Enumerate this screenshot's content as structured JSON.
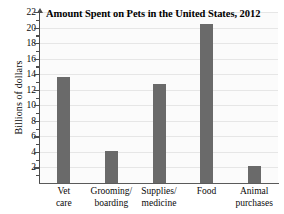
{
  "chart_data": {
    "type": "bar",
    "title": "Amount Spent on Pets in the United States, 2012",
    "xlabel": "",
    "ylabel": "Billions of dollars",
    "categories": [
      "Vet care",
      "Grooming/ boarding",
      "Supplies/ medicine",
      "Food",
      "Animal purchases"
    ],
    "category_lines": [
      [
        "Vet",
        "care"
      ],
      [
        "Grooming/",
        "boarding"
      ],
      [
        "Supplies/",
        "medicine"
      ],
      [
        "Food",
        ""
      ],
      [
        "Animal",
        "purchases"
      ]
    ],
    "values": [
      13.6,
      4.1,
      12.8,
      20.5,
      2.2
    ],
    "ylim": [
      0,
      22
    ],
    "ytick_values": [
      2,
      4,
      6,
      8,
      10,
      12,
      14,
      16,
      18,
      20,
      22
    ],
    "ytick_labels": [
      "2",
      "4",
      "6",
      "8",
      "10",
      "12",
      "14",
      "16",
      "18",
      "20",
      "22"
    ],
    "grid": true,
    "legend": "none",
    "bar_color": "#6a6a6a",
    "grid_color": "#e6e6e6",
    "axis_color": "#4c4c4c",
    "plot_background": "#fbfbfb"
  }
}
